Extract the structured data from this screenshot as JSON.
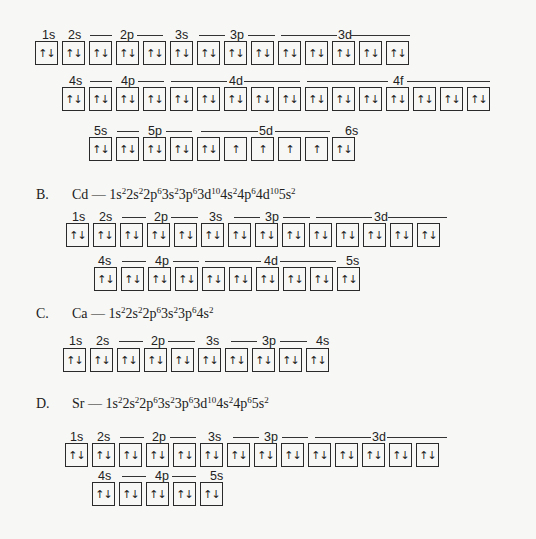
{
  "option_A_continued": {
    "rows": [
      {
        "label_row": [
          {
            "text": "1s",
            "x": 42
          },
          {
            "text": "2s",
            "x": 68
          },
          {
            "dash": [
              90,
              112
            ]
          },
          {
            "text": "2p",
            "x": 120
          },
          {
            "dash": [
              137,
              163
            ]
          },
          {
            "text": "3s",
            "x": 175
          },
          {
            "dash": [
              199,
              225
            ]
          },
          {
            "text": "3p",
            "x": 230
          },
          {
            "dash": [
              248,
              275
            ]
          },
          {
            "dash": [
              281,
              337
            ]
          },
          {
            "text": "3d",
            "x": 338
          },
          {
            "dash": [
              351,
              410
            ]
          }
        ],
        "boxes": [
          "↑↓",
          "↑↓",
          "↑↓",
          "↑↓",
          "↑↓",
          "↑↓",
          "↑↓",
          "↑↓",
          "↑↓",
          "↑↓",
          "↑↓",
          "↑↓",
          "↑↓",
          "↑↓"
        ]
      },
      {
        "label_row": [
          {
            "text": "4s",
            "x": 69
          },
          {
            "dash": [
              90,
              112
            ]
          },
          {
            "text": "4p",
            "x": 121
          },
          {
            "dash": [
              138,
              164
            ]
          },
          {
            "dash": [
              171,
              227
            ]
          },
          {
            "text": "4d",
            "x": 229
          },
          {
            "dash": [
              244,
              300
            ]
          },
          {
            "dash": [
              307,
              388
            ]
          },
          {
            "text": "4f",
            "x": 393
          },
          {
            "dash": [
              407,
              490
            ]
          }
        ],
        "boxes": [
          "↑↓",
          "↑↓",
          "↑↓",
          "↑↓",
          "↑↓",
          "↑↓",
          "↑↓",
          "↑↓",
          "↑↓",
          "↑↓",
          "↑↓",
          "↑↓",
          "↑↓",
          "↑↓",
          "↑↓",
          "↑↓"
        ]
      },
      {
        "label_row": [
          {
            "text": "5s",
            "x": 94
          },
          {
            "dash": [
              117,
              139
            ]
          },
          {
            "text": "5p",
            "x": 148
          },
          {
            "dash": [
              166,
              192
            ]
          },
          {
            "dash": [
              201,
              258
            ]
          },
          {
            "text": "5d",
            "x": 259
          },
          {
            "dash": [
              275,
              330
            ]
          },
          {
            "text": "6s",
            "x": 345
          }
        ],
        "boxes": [
          "↑↓",
          "↑↓",
          "↑↓",
          "↑↓",
          "↑↓",
          "↑",
          "↑",
          "↑",
          "↑",
          "↑↓"
        ]
      }
    ]
  },
  "option_B": {
    "letter": "B.",
    "element": "Cd",
    "config": [
      [
        "1s",
        "2"
      ],
      [
        "2s",
        "2"
      ],
      [
        "2p",
        "6"
      ],
      [
        "3s",
        "2"
      ],
      [
        "3p",
        "6"
      ],
      [
        "3d",
        "10"
      ],
      [
        "4s",
        "2"
      ],
      [
        "4p",
        "6"
      ],
      [
        "4d",
        "10"
      ],
      [
        "5s",
        "2"
      ]
    ],
    "rows": [
      {
        "label_row": [
          {
            "text": "1s",
            "x": 72
          },
          {
            "text": "2s",
            "x": 99
          },
          {
            "dash": [
              122,
              146
            ]
          },
          {
            "text": "2p",
            "x": 154
          },
          {
            "dash": [
              171,
              198
            ]
          },
          {
            "text": "3s",
            "x": 209
          },
          {
            "dash": [
              234,
              260
            ]
          },
          {
            "text": "3p",
            "x": 265
          },
          {
            "dash": [
              283,
              310
            ]
          },
          {
            "dash": [
              316,
              372
            ]
          },
          {
            "text": "3d",
            "x": 374
          },
          {
            "dash": [
              388,
              447
            ]
          }
        ],
        "boxes": [
          "↑↓",
          "↑↓",
          "↑↓",
          "↑↓",
          "↑↓",
          "↑↓",
          "↑↓",
          "↑↓",
          "↑↓",
          "↑↓",
          "↑↓",
          "↑↓",
          "↑↓",
          "↑↓"
        ]
      },
      {
        "label_row": [
          {
            "text": "4s",
            "x": 98
          },
          {
            "dash": [
              122,
              146
            ]
          },
          {
            "text": "4p",
            "x": 155
          },
          {
            "dash": [
              173,
              199
            ]
          },
          {
            "dash": [
              205,
              261
            ]
          },
          {
            "text": "4d",
            "x": 264
          },
          {
            "dash": [
              280,
              336
            ]
          },
          {
            "text": "5s",
            "x": 346
          }
        ],
        "boxes": [
          "↑↓",
          "↑↓",
          "↑↓",
          "↑↓",
          "↑↓",
          "↑↓",
          "↑↓",
          "↑↓",
          "↑↓",
          "↑↓"
        ]
      }
    ]
  },
  "option_C": {
    "letter": "C.",
    "element": "Ca",
    "config": [
      [
        "1s",
        "2"
      ],
      [
        "2s",
        "2"
      ],
      [
        "2p",
        "6"
      ],
      [
        "3s",
        "2"
      ],
      [
        "3p",
        "6"
      ],
      [
        "4s",
        "2"
      ]
    ],
    "rows": [
      {
        "label_row": [
          {
            "text": "1s",
            "x": 69
          },
          {
            "text": "2s",
            "x": 96
          },
          {
            "dash": [
              119,
              143
            ]
          },
          {
            "text": "2p",
            "x": 151
          },
          {
            "dash": [
              168,
              195
            ]
          },
          {
            "text": "3s",
            "x": 206
          },
          {
            "dash": [
              231,
              257
            ]
          },
          {
            "text": "3p",
            "x": 262
          },
          {
            "dash": [
              280,
              307
            ]
          },
          {
            "text": "4s",
            "x": 316
          }
        ],
        "boxes": [
          "↑↓",
          "↑↓",
          "↑↓",
          "↑↓",
          "↑↓",
          "↑↓",
          "↑↓",
          "↑↓",
          "↑↓",
          "↑↓"
        ]
      }
    ]
  },
  "option_D": {
    "letter": "D.",
    "element": "Sr",
    "config": [
      [
        "1s",
        "2"
      ],
      [
        "2s",
        "2"
      ],
      [
        "2p",
        "6"
      ],
      [
        "3s",
        "2"
      ],
      [
        "3p",
        "6"
      ],
      [
        "3d",
        "10"
      ],
      [
        "4s",
        "2"
      ],
      [
        "4p",
        "6"
      ],
      [
        "5s",
        "2"
      ]
    ],
    "rows": [
      {
        "label_row": [
          {
            "text": "1s",
            "x": 70
          },
          {
            "text": "2s",
            "x": 97
          },
          {
            "dash": [
              120,
              144
            ]
          },
          {
            "text": "2p",
            "x": 152
          },
          {
            "dash": [
              170,
              196
            ]
          },
          {
            "text": "3s",
            "x": 208
          },
          {
            "dash": [
              233,
              259
            ]
          },
          {
            "text": "3p",
            "x": 264
          },
          {
            "dash": [
              282,
              308
            ]
          },
          {
            "dash": [
              315,
              371
            ]
          },
          {
            "text": "3d",
            "x": 372
          },
          {
            "dash": [
              387,
              447
            ]
          }
        ],
        "boxes": [
          "↑↓",
          "↑↓",
          "↑↓",
          "↑↓",
          "↑↓",
          "↑↓",
          "↑↓",
          "↑↓",
          "↑↓",
          "↑↓",
          "↑↓",
          "↑↓",
          "↑↓",
          "↑↓"
        ]
      },
      {
        "label_row": [
          {
            "text": "4s",
            "x": 98
          },
          {
            "dash": [
              122,
              146
            ]
          },
          {
            "text": "4p",
            "x": 155
          },
          {
            "dash": [
              172,
              196
            ]
          },
          {
            "text": "5s",
            "x": 210
          }
        ],
        "boxes": [
          "↑↓",
          "↑↓",
          "↑↓",
          "↑↓",
          "↑↓"
        ]
      }
    ]
  }
}
